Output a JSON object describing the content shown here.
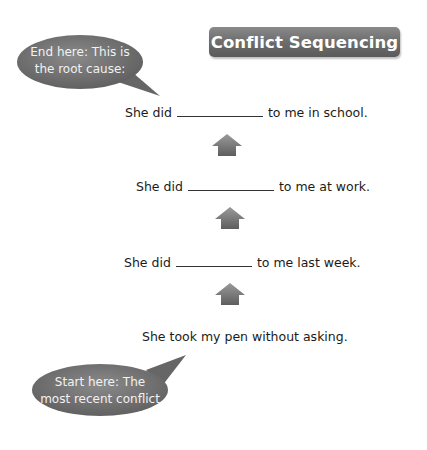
{
  "title": "Conflict Sequencing",
  "bubbles": {
    "end": {
      "line1": "End here: This is",
      "line2": "the root cause:"
    },
    "start": {
      "line1": "Start here: The",
      "line2": "most recent conflict"
    }
  },
  "steps": [
    {
      "prefix": "She did",
      "blank": "",
      "suffix": "to me in school."
    },
    {
      "prefix": "She did",
      "blank": "",
      "suffix": "to me at work."
    },
    {
      "prefix": "She did",
      "blank": "",
      "suffix": "to me last week."
    }
  ],
  "start_event": "She took my pen without asking.",
  "arrows": [
    "up-arrow",
    "up-arrow",
    "up-arrow"
  ],
  "colors": {
    "bubble": "#6e6e6e",
    "banner": "#6f6f6f",
    "arrow": "#7a7a7a"
  }
}
